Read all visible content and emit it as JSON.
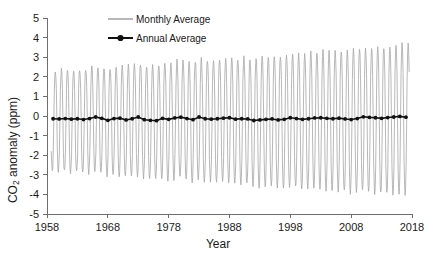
{
  "chart_data": {
    "type": "line",
    "title": "",
    "xlabel": "Year",
    "ylabel": "CO2 anomaly (ppm)",
    "ylabel_parts": {
      "pre": "CO",
      "sub": "2",
      "post": " anomaly (ppm)"
    },
    "xlim": [
      1958,
      2018
    ],
    "ylim": [
      -5,
      5
    ],
    "grid": false,
    "legend_position": "top-center",
    "xticks": [
      1958,
      1968,
      1978,
      1988,
      1998,
      2008,
      2018
    ],
    "xtick_labels": [
      "1958",
      "1968",
      "1978",
      "1988",
      "1998",
      "2008",
      "2018"
    ],
    "yticks": [
      5,
      4,
      3,
      2,
      1,
      0,
      -1,
      -2,
      -3,
      -4,
      -5
    ],
    "ytick_labels": [
      "5",
      "4",
      "3",
      "2",
      "1",
      "0",
      "-1",
      "-2",
      "-3",
      "-4",
      "-5"
    ],
    "series": [
      {
        "name": "Monthly Average",
        "color": "#a6a6a6",
        "type": "line",
        "description": "Monthly CO2 anomaly showing strong seasonal cycle, amplitude growing from about +2.2/-2.8 ppm in 1959 to about +3.5/-4.1 ppm in 2017",
        "x_start": 1958.7,
        "x_end": 2017.6,
        "samples_per_year": 12,
        "amplitude_peak_start": 2.25,
        "amplitude_peak_end": 3.5,
        "amplitude_trough_start": -2.85,
        "amplitude_trough_end": -4.15,
        "peak_month_fraction": 0.37,
        "trough_month_fraction": 0.79
      },
      {
        "name": "Annual Average",
        "color": "#111111",
        "type": "line-marker",
        "marker": "circle",
        "x": [
          1959,
          1960,
          1961,
          1962,
          1963,
          1964,
          1965,
          1966,
          1967,
          1968,
          1969,
          1970,
          1971,
          1972,
          1973,
          1974,
          1975,
          1976,
          1977,
          1978,
          1979,
          1980,
          1981,
          1982,
          1983,
          1984,
          1985,
          1986,
          1987,
          1988,
          1989,
          1990,
          1991,
          1992,
          1993,
          1994,
          1995,
          1996,
          1997,
          1998,
          1999,
          2000,
          2001,
          2002,
          2003,
          2004,
          2005,
          2006,
          2007,
          2008,
          2009,
          2010,
          2011,
          2012,
          2013,
          2014,
          2015,
          2016,
          2017
        ],
        "values": [
          -0.14,
          -0.15,
          -0.13,
          -0.16,
          -0.14,
          -0.18,
          -0.13,
          -0.05,
          -0.12,
          -0.22,
          -0.13,
          -0.11,
          -0.2,
          -0.14,
          -0.05,
          -0.19,
          -0.22,
          -0.24,
          -0.12,
          -0.17,
          -0.1,
          -0.06,
          -0.13,
          -0.19,
          -0.05,
          -0.14,
          -0.16,
          -0.14,
          -0.11,
          -0.09,
          -0.16,
          -0.14,
          -0.15,
          -0.23,
          -0.2,
          -0.17,
          -0.15,
          -0.2,
          -0.17,
          -0.09,
          -0.13,
          -0.17,
          -0.14,
          -0.1,
          -0.09,
          -0.12,
          -0.14,
          -0.11,
          -0.15,
          -0.18,
          -0.13,
          -0.04,
          -0.07,
          -0.09,
          -0.12,
          -0.08,
          -0.05,
          -0.02,
          -0.06
        ]
      }
    ],
    "legend": [
      {
        "label": "Monthly Average",
        "color": "#a6a6a6",
        "marker": false
      },
      {
        "label": "Annual Average",
        "color": "#111111",
        "marker": true
      }
    ]
  }
}
